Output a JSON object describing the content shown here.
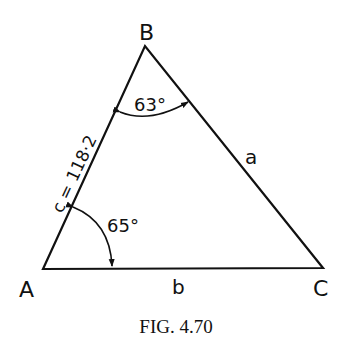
{
  "figure": {
    "caption": "Fig. 4.70",
    "caption_display": "FIG. 4.70",
    "vertices": {
      "A": {
        "label": "A"
      },
      "B": {
        "label": "B"
      },
      "C": {
        "label": "C"
      }
    },
    "sides": {
      "a": {
        "label": "a"
      },
      "b": {
        "label": "b"
      },
      "c": {
        "label": "c = 118·2",
        "value": 118.2
      }
    },
    "angles": {
      "A": {
        "label": "65°",
        "value": 65
      },
      "B": {
        "label": "63°",
        "value": 63
      }
    },
    "colors": {
      "stroke": "#111111",
      "background": "#ffffff"
    }
  }
}
